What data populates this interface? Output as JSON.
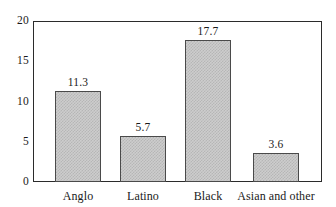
{
  "chart_data": {
    "type": "bar",
    "title": "",
    "subtitle": "",
    "xlabel": "",
    "ylabel": "",
    "categories": [
      "Anglo",
      "Latino",
      "Black",
      "Asian and other"
    ],
    "values": [
      11.3,
      5.7,
      17.7,
      3.6
    ],
    "value_labels": [
      "11.3",
      "5.7",
      "17.7",
      "3.6"
    ],
    "ylim": [
      0,
      20
    ],
    "ytick_labels": [
      "0",
      "5",
      "10",
      "15",
      "20"
    ],
    "ytick_values": [
      0,
      5,
      10,
      15,
      20
    ],
    "grid": false,
    "legend": null,
    "legend_position": "none",
    "bar_fill_color": "#c6c6c6",
    "bar_border_color": "#4a4a4a",
    "axis_color": "#2b2b2b",
    "background_color": "#ffffff",
    "annotations": []
  }
}
